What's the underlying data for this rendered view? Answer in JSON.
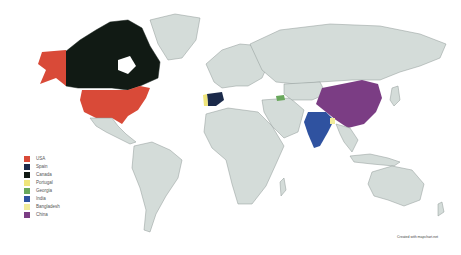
{
  "map": {
    "title": "",
    "background_color": "#ffffff",
    "land_color": "#d4dcd9",
    "border_color": "#8f9896"
  },
  "highlighted_countries": [
    {
      "name": "USA",
      "color": "#d94a38"
    },
    {
      "name": "Spain",
      "color": "#1b2a4a"
    },
    {
      "name": "Canada",
      "color": "#111a14"
    },
    {
      "name": "Portugal",
      "color": "#efe57a"
    },
    {
      "name": "Georgia",
      "color": "#69a85c"
    },
    {
      "name": "India",
      "color": "#2f52a0"
    },
    {
      "name": "Bangladesh",
      "color": "#f1ec9b"
    },
    {
      "name": "China",
      "color": "#7b3d84"
    }
  ],
  "legend": {
    "items": [
      {
        "label": "USA",
        "color": "#d94a38"
      },
      {
        "label": "Spain",
        "color": "#1b2a4a"
      },
      {
        "label": "Canada",
        "color": "#111a14"
      },
      {
        "label": "Portugal",
        "color": "#efe57a"
      },
      {
        "label": "Georgia",
        "color": "#69a85c"
      },
      {
        "label": "India",
        "color": "#2f52a0"
      },
      {
        "label": "Bangladesh",
        "color": "#f1ec9b"
      },
      {
        "label": "China",
        "color": "#7b3d84"
      }
    ]
  },
  "credit": "Created with mapchart.net"
}
